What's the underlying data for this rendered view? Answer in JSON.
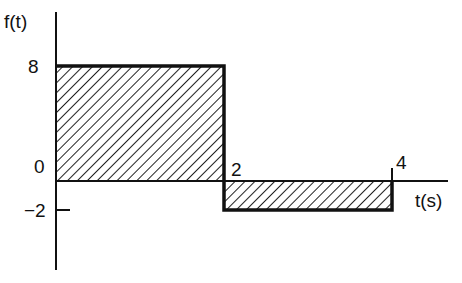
{
  "diagram": {
    "type": "piecewise-constant signal plot",
    "y_axis_label": "f(t)",
    "x_axis_label": "t(s)",
    "y_ticks": [
      "8",
      "0",
      "−2"
    ],
    "x_ticks": [
      "2",
      "4"
    ],
    "segments": [
      {
        "t_start": 0,
        "t_end": 2,
        "value": 8,
        "shaded": true
      },
      {
        "t_start": 2,
        "t_end": 4,
        "value": -2,
        "shaded": true
      }
    ],
    "colors": {
      "line": "#111111",
      "hatch": "#222222",
      "background": "#ffffff"
    }
  }
}
